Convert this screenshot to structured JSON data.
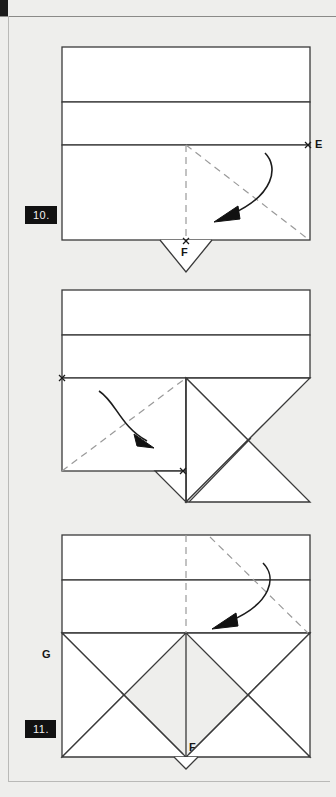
{
  "page": {
    "background_color": "#eeeeec",
    "line_color": "#3a3a3a",
    "fill_color": "#ffffff",
    "badge_bg": "#111111",
    "badge_text_color": "#f2f2f2"
  },
  "steps": [
    {
      "number": "10.",
      "caption_point_labels": [
        "E",
        "F"
      ],
      "description": "Rectangular paper with two horizontal creases; dashed diagonal valley folds from center to corner E, curved fold arrow pointing down-right; small point F at bottom with a shallow V flap below."
    },
    {
      "number": "11.",
      "caption_point_labels": [
        "G",
        "F"
      ],
      "description": "Same rectangle with right half collapsed into triangular flaps; dashed diagonal from lower-left to center top, curved fold arrow pointing down-right; points G at left edge and F at centre bottom."
    },
    {
      "number": "12.",
      "caption_point_labels": [],
      "description": "Symmetric result: both sides collapsed into mirrored triangular points below the banded rectangle; dashed vertical centre line and dashed diagonal on the right with a curved fold arrow."
    }
  ],
  "markers": {
    "E": "E",
    "F": "F",
    "G": "G"
  },
  "icons": {
    "fold_arrow": "curved-fold-arrow-icon",
    "cross_mark": "cross-point-marker-icon"
  }
}
